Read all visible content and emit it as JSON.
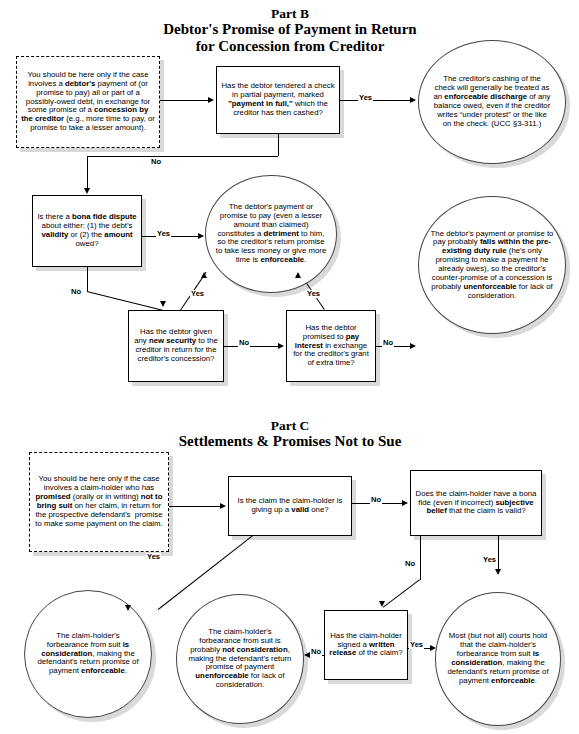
{
  "document": {
    "partB": {
      "line1": "Part B",
      "line2": "Debtor's Promise of Payment in Return",
      "line3": "for Concession from Creditor"
    },
    "partC": {
      "line1": "Part C",
      "line2": "Settlements & Promises Not to Sue"
    }
  },
  "partB_nodes": {
    "start": {
      "type": "dashed-box",
      "text_html": "You should be here only if the case involves a <b>debtor's</b> payment of (or promise to pay) all or part of a possibly-owed debt, in exchange for some promise of a <b>concession by the creditor</b> (e.g., more time to pay, or promise to take a lesser amount)."
    },
    "q_check_full": {
      "type": "box",
      "text_html": "Has the debtor tendered a check in partial payment, marked <b>\"payment in full,\"</b> which the creditor has then cashed?"
    },
    "out_discharge": {
      "type": "ellipse",
      "text_html": "The creditor's cashing of the check will generally be treated as an <b>enforceable discharge</b> of any balance owed, even if the creditor writes “under protest” or the like on the check. (UCC §3-311.)"
    },
    "q_bona_fide": {
      "type": "box",
      "text_html": "Is there a <b>bona fide dispute</b> about either: (1) the debt's <b>validity</b> or (2) the <b>amount</b> owed?"
    },
    "out_detriment": {
      "type": "ellipse",
      "text_html": "The debtor's payment or promise to pay (even a lesser amount than claimed) constitutes a <b>detriment</b> to him, so the creditor's return promise to take less money or give more time is <b>enforceable</b>."
    },
    "q_new_security": {
      "type": "box",
      "text_html": "Has the debtor given any <b>new security</b> to the creditor in return for the creditor's concession?"
    },
    "q_pay_interest": {
      "type": "box",
      "text_html": "Has the debtor promised to <b>pay interest</b> in exchange for the creditor's grant of extra time?"
    },
    "out_preexisting_duty": {
      "type": "ellipse",
      "text_html": "The debtor's payment or promise to pay probably <b>falls within the pre-existing duty rule</b> (he's only promising to make a payment he already owes), so the creditor's counter-promise of a concession is probably <b>unenforceable</b> for lack of consideration."
    }
  },
  "partC_nodes": {
    "start": {
      "type": "dashed-box",
      "text_html": "You should be here only if the case involves a claim-holder who has <b>promised</b> (orally or in writing) <b>not to bring suit</b> on her claim, in return for the prospective defendant's&nbsp; promise to make some payment on the claim."
    },
    "q_valid_claim": {
      "type": "box",
      "text_html": "Is the claim the claim-holder is giving up a <b>valid</b> one?"
    },
    "q_subjective_belief": {
      "type": "box",
      "text_html": "Does the claim-holder have a bona fide (even if incorrect) <b>subjective belief</b> that the claim is valid?"
    },
    "q_written_release": {
      "type": "box",
      "text_html": "Has the claim-holder signed a <b>written release</b> of the claim?"
    },
    "out_is_consideration": {
      "type": "ellipse",
      "text_html": "The claim-holder's forbearance from suit <b>is consideration</b>, making the defendant's return promise of payment <b>enforceable</b>."
    },
    "out_not_consideration": {
      "type": "ellipse",
      "text_html": "The claim-holder's forbearance from suit is probably <b>not consideration</b>, making the defendant's return promise of payment <b>unenforceable</b> for lack of consideration."
    },
    "out_most_courts": {
      "type": "ellipse",
      "text_html": "Most (but not all) courts hold that the claim-holder's forbearance from suit <b>is consideration</b>, making the defendant's return promise of payment <b>enforceable</b>."
    }
  },
  "edge_labels": {
    "b_yes_check": "Yes",
    "b_no_check": "No",
    "b_yes_bonafide": "Yes",
    "b_no_bonafide": "No",
    "b_yes_security": "Yes",
    "b_no_security": "No",
    "b_yes_interest": "Yes",
    "b_no_interest": "No",
    "c_yes_start": "Yes",
    "c_no_valid": "No",
    "c_no_subjective": "No",
    "c_yes_subjective": "Yes",
    "c_no_release": "No",
    "c_yes_release": "Yes"
  },
  "colors": {
    "stroke": "#000000",
    "shadow": "#d9d9d9",
    "background": "#ffffff",
    "ellipse_stroke": "#444444"
  }
}
